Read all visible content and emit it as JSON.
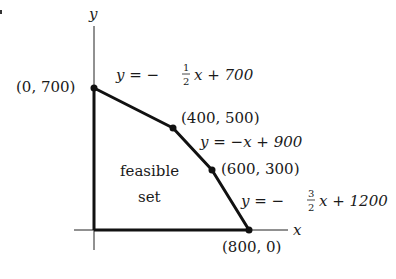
{
  "diagram": {
    "type": "linear-programming-feasible-region",
    "axes": {
      "x_label": "x",
      "y_label": "y"
    },
    "region_label": {
      "line1": "feasible",
      "line2": "set"
    },
    "vertices": [
      {
        "label": "(0, 700)",
        "x": 0,
        "y": 700
      },
      {
        "label": "(400, 500)",
        "x": 400,
        "y": 500
      },
      {
        "label": "(600, 300)",
        "x": 600,
        "y": 300
      },
      {
        "label": "(800, 0)",
        "x": 800,
        "y": 0
      }
    ],
    "constraints": [
      {
        "lhs": "y = −",
        "frac_num": "1",
        "frac_den": "2",
        "rhs": "x + 700"
      },
      {
        "lhs": "y = −x + 900",
        "frac_num": "",
        "frac_den": "",
        "rhs": ""
      },
      {
        "lhs": "y = −",
        "frac_num": "3",
        "frac_den": "2",
        "rhs": "x + 1200"
      }
    ],
    "colors": {
      "line": "#111111",
      "text": "#1a1a1a",
      "background": "#ffffff"
    }
  }
}
